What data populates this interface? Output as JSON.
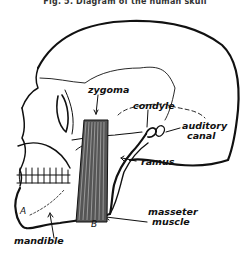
{
  "figure": {
    "title": "Fig. 5. Diagram of the human skull"
  },
  "labels": {
    "zygoma": "zygoma",
    "condyle": "condyle",
    "auditory_canal_line1": "auditory",
    "auditory_canal_line2": "canal",
    "ramus": "ramus",
    "masseter_line1": "masseter",
    "masseter_line2": "muscle",
    "mandible": "mandible",
    "point_a": "A",
    "point_b": "B"
  },
  "colors": {
    "line": "#111111",
    "background": "#ffffff"
  }
}
